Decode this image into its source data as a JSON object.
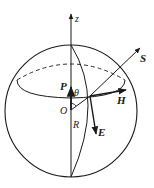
{
  "diagram": {
    "labels": {
      "z": "z",
      "S": "S",
      "H": "H",
      "P": "P",
      "theta": "θ",
      "O": "O",
      "R": "R",
      "E": "E"
    },
    "colors": {
      "stroke": "#1a1a1a",
      "background": "#ffffff"
    }
  }
}
